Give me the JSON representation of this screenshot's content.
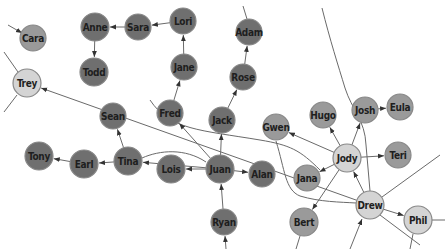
{
  "colors": {
    "dark": "#6f6f6f",
    "medium": "#9a9a9a",
    "light": "#d4d4d4",
    "edge": "#6a6a6a",
    "background": "#ffffff"
  },
  "nodes": [
    {
      "id": "Cara",
      "label": "Cara",
      "x": 33,
      "y": 38,
      "r": 13,
      "shade": "medium"
    },
    {
      "id": "Trey",
      "label": "Trey",
      "x": 27,
      "y": 83,
      "r": 14,
      "shade": "light"
    },
    {
      "id": "Anne",
      "label": "Anne",
      "x": 95,
      "y": 27,
      "r": 14,
      "shade": "dark"
    },
    {
      "id": "Sara",
      "label": "Sara",
      "x": 138,
      "y": 27,
      "r": 13,
      "shade": "dark"
    },
    {
      "id": "Lori",
      "label": "Lori",
      "x": 183,
      "y": 21,
      "r": 13,
      "shade": "dark"
    },
    {
      "id": "Todd",
      "label": "Todd",
      "x": 94,
      "y": 72,
      "r": 14,
      "shade": "dark"
    },
    {
      "id": "Jane",
      "label": "Jane",
      "x": 184,
      "y": 67,
      "r": 13,
      "shade": "dark"
    },
    {
      "id": "Fred",
      "label": "Fred",
      "x": 170,
      "y": 113,
      "r": 13,
      "shade": "dark"
    },
    {
      "id": "Adam",
      "label": "Adam",
      "x": 249,
      "y": 32,
      "r": 13,
      "shade": "dark"
    },
    {
      "id": "Rose",
      "label": "Rose",
      "x": 243,
      "y": 77,
      "r": 13,
      "shade": "dark"
    },
    {
      "id": "Jack",
      "label": "Jack",
      "x": 222,
      "y": 120,
      "r": 13,
      "shade": "dark"
    },
    {
      "id": "Sean",
      "label": "Sean",
      "x": 113,
      "y": 116,
      "r": 13,
      "shade": "dark"
    },
    {
      "id": "Tina",
      "label": "Tina",
      "x": 128,
      "y": 161,
      "r": 14,
      "shade": "dark"
    },
    {
      "id": "Earl",
      "label": "Earl",
      "x": 84,
      "y": 164,
      "r": 14,
      "shade": "dark"
    },
    {
      "id": "Tony",
      "label": "Tony",
      "x": 39,
      "y": 156,
      "r": 14,
      "shade": "dark"
    },
    {
      "id": "Lois",
      "label": "Lois",
      "x": 171,
      "y": 169,
      "r": 14,
      "shade": "dark"
    },
    {
      "id": "Juan",
      "label": "Juan",
      "x": 220,
      "y": 169,
      "r": 14,
      "shade": "dark"
    },
    {
      "id": "Alan",
      "label": "Alan",
      "x": 262,
      "y": 174,
      "r": 13,
      "shade": "dark"
    },
    {
      "id": "Ryan",
      "label": "Ryan",
      "x": 224,
      "y": 222,
      "r": 13,
      "shade": "dark"
    },
    {
      "id": "Gwen",
      "label": "Gwen",
      "x": 276,
      "y": 127,
      "r": 13,
      "shade": "medium"
    },
    {
      "id": "Hugo",
      "label": "Hugo",
      "x": 323,
      "y": 115,
      "r": 13,
      "shade": "medium"
    },
    {
      "id": "Josh",
      "label": "Josh",
      "x": 365,
      "y": 110,
      "r": 13,
      "shade": "medium"
    },
    {
      "id": "Eula",
      "label": "Eula",
      "x": 400,
      "y": 107,
      "r": 13,
      "shade": "medium"
    },
    {
      "id": "Jody",
      "label": "Jody",
      "x": 347,
      "y": 158,
      "r": 14,
      "shade": "light"
    },
    {
      "id": "Teri",
      "label": "Teri",
      "x": 398,
      "y": 155,
      "r": 13,
      "shade": "medium"
    },
    {
      "id": "Jana",
      "label": "Jana",
      "x": 307,
      "y": 178,
      "r": 13,
      "shade": "medium"
    },
    {
      "id": "Drew",
      "label": "Drew",
      "x": 370,
      "y": 205,
      "r": 14,
      "shade": "light"
    },
    {
      "id": "Bert",
      "label": "Bert",
      "x": 304,
      "y": 222,
      "r": 14,
      "shade": "medium"
    },
    {
      "id": "Phil",
      "label": "Phil",
      "x": 418,
      "y": 220,
      "r": 14,
      "shade": "light"
    }
  ],
  "edges": [
    {
      "from": "Sara",
      "to": "Anne"
    },
    {
      "from": "Lori",
      "to": "Sara"
    },
    {
      "from": "Anne",
      "to": "Todd"
    },
    {
      "from": "Jane",
      "to": "Lori"
    },
    {
      "from": "Fred",
      "to": "Jane"
    },
    {
      "from": "Rose",
      "to": "Adam"
    },
    {
      "from": "Jack",
      "to": "Rose"
    },
    {
      "from": "Tina",
      "to": "Sean"
    },
    {
      "from": "Tina",
      "to": "Earl"
    },
    {
      "from": "Earl",
      "to": "Tony"
    },
    {
      "from": "Juan",
      "to": "Lois"
    },
    {
      "from": "Juan",
      "to": "Alan"
    },
    {
      "from": "Juan",
      "to": "Jack"
    },
    {
      "from": "Juan",
      "to": "Fred"
    },
    {
      "from": "Juan",
      "to": "Tina"
    },
    {
      "from": "Ryan",
      "to": "Juan"
    },
    {
      "from": "Josh",
      "to": "Eula"
    },
    {
      "from": "Jody",
      "to": "Teri"
    },
    {
      "from": "Jody",
      "to": "Josh"
    },
    {
      "from": "Jody",
      "to": "Hugo"
    },
    {
      "from": "Jody",
      "to": "Gwen"
    },
    {
      "from": "Jody",
      "to": "Jana"
    },
    {
      "from": "Jody",
      "to": "Bert"
    },
    {
      "from": "Drew",
      "to": "Jody"
    },
    {
      "from": "Drew",
      "to": "Phil"
    },
    {
      "from": "Drew",
      "to": "Trey"
    }
  ]
}
